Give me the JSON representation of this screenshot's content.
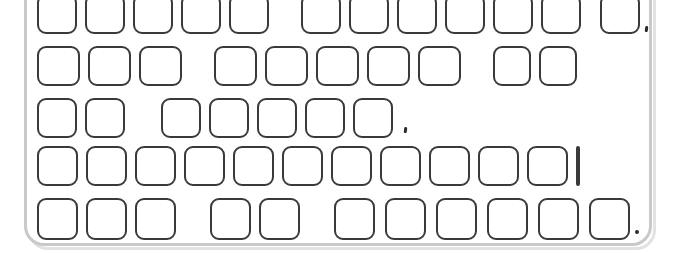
{
  "scene": {
    "title": "Keyboard line drawing",
    "width": 676,
    "height": 253,
    "background_color": "#ffffff",
    "key_outline_color": "#3a3a3c",
    "key_fill_color": "#ffffff",
    "body_outline_color": "#c9c9c9",
    "body_shadow_color": "#e2e2e2",
    "mark_color": "#2b2b2d"
  },
  "keyboard": {
    "name": "keyboard",
    "body": {
      "x": 24,
      "y": -34,
      "width": 628,
      "height": 280,
      "radius": 20
    },
    "rows": [
      {
        "name": "function-row",
        "index": 1,
        "key_count": 12,
        "keys": [
          {
            "x": 37,
            "y": -6,
            "w": 40,
            "h": 40
          },
          {
            "x": 85,
            "y": -6,
            "w": 40,
            "h": 40
          },
          {
            "x": 133,
            "y": -6,
            "w": 40,
            "h": 40
          },
          {
            "x": 181,
            "y": -6,
            "w": 40,
            "h": 40
          },
          {
            "x": 229,
            "y": -6,
            "w": 40,
            "h": 40
          },
          {
            "x": 301,
            "y": -6,
            "w": 40,
            "h": 40
          },
          {
            "x": 349,
            "y": -6,
            "w": 40,
            "h": 40
          },
          {
            "x": 397,
            "y": -6,
            "w": 40,
            "h": 40
          },
          {
            "x": 445,
            "y": -6,
            "w": 40,
            "h": 40
          },
          {
            "x": 493,
            "y": -6,
            "w": 40,
            "h": 40
          },
          {
            "x": 541,
            "y": -6,
            "w": 40,
            "h": 40
          },
          {
            "x": 600,
            "y": -6,
            "w": 40,
            "h": 40
          }
        ],
        "marks": [
          {
            "x": 645,
            "y": 26,
            "kind": "comma"
          }
        ]
      },
      {
        "name": "number-row",
        "index": 2,
        "key_count": 10,
        "keys": [
          {
            "x": 37,
            "y": 46,
            "w": 43,
            "h": 40
          },
          {
            "x": 88,
            "y": 46,
            "w": 43,
            "h": 40
          },
          {
            "x": 139,
            "y": 46,
            "w": 43,
            "h": 40
          },
          {
            "x": 214,
            "y": 46,
            "w": 43,
            "h": 40
          },
          {
            "x": 265,
            "y": 46,
            "w": 43,
            "h": 40
          },
          {
            "x": 316,
            "y": 46,
            "w": 43,
            "h": 40
          },
          {
            "x": 367,
            "y": 46,
            "w": 43,
            "h": 40
          },
          {
            "x": 418,
            "y": 46,
            "w": 43,
            "h": 40
          },
          {
            "x": 493,
            "y": 46,
            "w": 38,
            "h": 40
          },
          {
            "x": 539,
            "y": 46,
            "w": 38,
            "h": 40
          }
        ],
        "marks": []
      },
      {
        "name": "upper-letter-row",
        "index": 3,
        "key_count": 7,
        "keys": [
          {
            "x": 37,
            "y": 98,
            "w": 40,
            "h": 40
          },
          {
            "x": 85,
            "y": 98,
            "w": 40,
            "h": 40
          },
          {
            "x": 161,
            "y": 98,
            "w": 40,
            "h": 40
          },
          {
            "x": 209,
            "y": 98,
            "w": 40,
            "h": 40
          },
          {
            "x": 257,
            "y": 98,
            "w": 40,
            "h": 40
          },
          {
            "x": 305,
            "y": 98,
            "w": 40,
            "h": 40
          },
          {
            "x": 353,
            "y": 98,
            "w": 40,
            "h": 40
          }
        ],
        "marks": [
          {
            "x": 404,
            "y": 127,
            "kind": "comma"
          }
        ]
      },
      {
        "name": "home-letter-row",
        "index": 4,
        "key_count": 12,
        "keys": [
          {
            "x": 37,
            "y": 146,
            "w": 41,
            "h": 40
          },
          {
            "x": 86,
            "y": 146,
            "w": 41,
            "h": 40
          },
          {
            "x": 135,
            "y": 146,
            "w": 41,
            "h": 40
          },
          {
            "x": 184,
            "y": 146,
            "w": 41,
            "h": 40
          },
          {
            "x": 233,
            "y": 146,
            "w": 41,
            "h": 40
          },
          {
            "x": 282,
            "y": 146,
            "w": 41,
            "h": 40
          },
          {
            "x": 331,
            "y": 146,
            "w": 41,
            "h": 40
          },
          {
            "x": 380,
            "y": 146,
            "w": 41,
            "h": 40
          },
          {
            "x": 429,
            "y": 146,
            "w": 41,
            "h": 40
          },
          {
            "x": 478,
            "y": 146,
            "w": 41,
            "h": 40
          },
          {
            "x": 527,
            "y": 146,
            "w": 41,
            "h": 40
          },
          {
            "x": 576,
            "y": 146,
            "w": 2,
            "h": 40
          }
        ],
        "marks": []
      },
      {
        "name": "bottom-row",
        "index": 5,
        "key_count": 13,
        "keys": [
          {
            "x": 37,
            "y": 198,
            "w": 41,
            "h": 42
          },
          {
            "x": 86,
            "y": 198,
            "w": 41,
            "h": 42
          },
          {
            "x": 135,
            "y": 198,
            "w": 41,
            "h": 42
          },
          {
            "x": 210,
            "y": 198,
            "w": 41,
            "h": 42
          },
          {
            "x": 259,
            "y": 198,
            "w": 41,
            "h": 42
          },
          {
            "x": 334,
            "y": 198,
            "w": 41,
            "h": 42
          },
          {
            "x": 385,
            "y": 198,
            "w": 41,
            "h": 42
          },
          {
            "x": 436,
            "y": 198,
            "w": 41,
            "h": 42
          },
          {
            "x": 487,
            "y": 198,
            "w": 41,
            "h": 42
          },
          {
            "x": 538,
            "y": 198,
            "w": 41,
            "h": 42
          },
          {
            "x": 589,
            "y": 198,
            "w": 41,
            "h": 42
          }
        ],
        "marks": [
          {
            "x": 635,
            "y": 230,
            "kind": "dot"
          }
        ]
      }
    ]
  }
}
